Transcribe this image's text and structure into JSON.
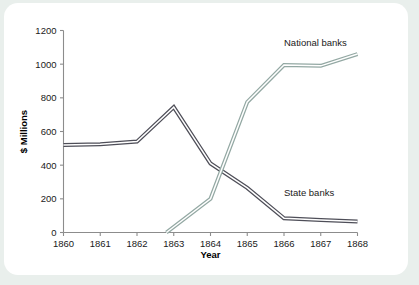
{
  "figure": {
    "background_color": "#e9efec",
    "card_color": "#ffffff"
  },
  "chart_data": {
    "type": "line",
    "title": "",
    "xlabel": "Year",
    "ylabel": "$ Millions",
    "x": [
      1860,
      1861,
      1862,
      1863,
      1864,
      1865,
      1866,
      1867,
      1868
    ],
    "categories": [
      "1860",
      "1861",
      "1862",
      "1863",
      "1864",
      "1865",
      "1866",
      "1867",
      "1868"
    ],
    "xlim": [
      1860,
      1868
    ],
    "ylim": [
      0,
      1200
    ],
    "yticks": [
      0,
      200,
      400,
      600,
      800,
      1000,
      1200
    ],
    "ytick_labels": [
      "0",
      "200",
      "400",
      "600",
      "800",
      "1000",
      "1200"
    ],
    "grid": false,
    "legend_position": "inline-annotations",
    "series": [
      {
        "name": "State banks",
        "color": "#4e4e58",
        "x": [
          1860,
          1861,
          1862,
          1863,
          1864,
          1865,
          1866,
          1867,
          1868
        ],
        "values": [
          520,
          525,
          540,
          745,
          410,
          265,
          85,
          75,
          65
        ]
      },
      {
        "name": "National banks",
        "color": "#93a8a3",
        "x": [
          1862.8,
          1864,
          1865,
          1866,
          1867,
          1868
        ],
        "values": [
          0,
          200,
          775,
          995,
          990,
          1060
        ]
      }
    ],
    "annotations": [
      {
        "text": "National banks",
        "x": 1866.0,
        "y": 1105
      },
      {
        "text": "State banks",
        "x": 1866.0,
        "y": 215
      }
    ]
  },
  "axis": {
    "y_title": "$ Millions",
    "x_title": "Year"
  },
  "labels": {
    "y_0": "0",
    "y_200": "200",
    "y_400": "400",
    "y_600": "600",
    "y_800": "800",
    "y_1000": "1000",
    "y_1200": "1200",
    "x_1860": "1860",
    "x_1861": "1861",
    "x_1862": "1862",
    "x_1863": "1863",
    "x_1864": "1864",
    "x_1865": "1865",
    "x_1866": "1866",
    "x_1867": "1867",
    "x_1868": "1868",
    "series_national": "National banks",
    "series_state": "State banks"
  }
}
